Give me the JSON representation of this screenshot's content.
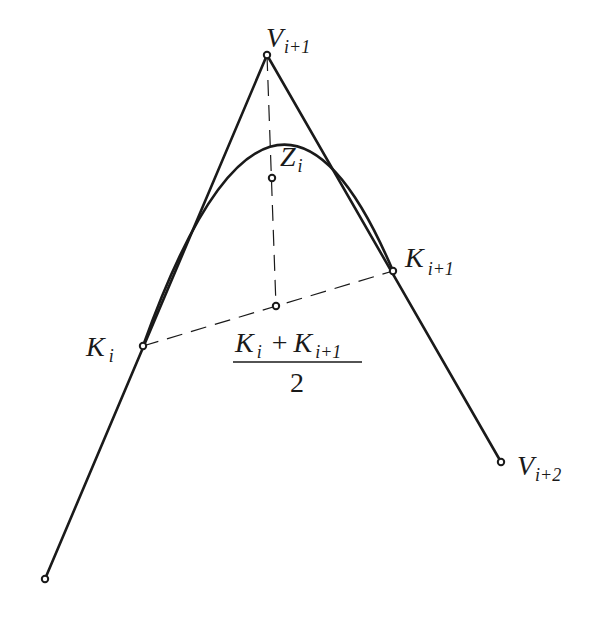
{
  "diagram": {
    "type": "quadratic-bspline-segment-construction",
    "colors": {
      "ink": "#1a1a1a",
      "background": "#ffffff"
    },
    "points": {
      "V_i": {
        "x": 45,
        "y": 579
      },
      "V_i1": {
        "x": 267,
        "y": 55
      },
      "V_i2": {
        "x": 501,
        "y": 462
      },
      "K_i": {
        "x": 143,
        "y": 346
      },
      "K_i1": {
        "x": 393,
        "y": 271
      },
      "Z_i": {
        "x": 272,
        "y": 178
      },
      "M": {
        "x": 276,
        "y": 306
      }
    },
    "labels": {
      "v_i1": {
        "main": "V",
        "sub": "i+1"
      },
      "z_i": {
        "main": "Z",
        "sub": "i"
      },
      "k_i1": {
        "main": "K",
        "sub": "i+1"
      },
      "k_i": {
        "main": "K",
        "sub": "i"
      },
      "v_i2": {
        "main": "V",
        "sub": "i+2"
      },
      "midpoint_formula": {
        "numerator_a_main": "K",
        "numerator_a_sub": "i",
        "plus": "+",
        "numerator_b_main": "K",
        "numerator_b_sub": "i+1",
        "denominator": "2"
      }
    }
  }
}
